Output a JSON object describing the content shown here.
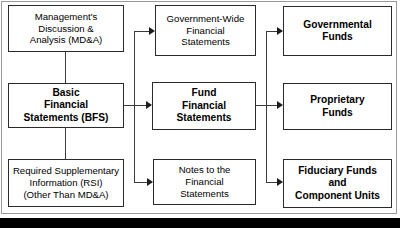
{
  "diagram": {
    "background_color": "#ffffff",
    "line_color": "#3a3a3a",
    "box_border_color": "#2b2b2b",
    "frame_color": "#9a9a9a",
    "bottom_bar_color": "#000000",
    "nodes": [
      {
        "id": "mda",
        "label": "Management's\nDiscussion &\nAnalysis (MD&A)",
        "weight": "normal",
        "column": "left",
        "row": "top"
      },
      {
        "id": "bfs",
        "label": "Basic\nFinancial\nStatements (BFS)",
        "weight": "bold",
        "column": "left",
        "row": "middle"
      },
      {
        "id": "rsi",
        "label": "Required Supplementary\nInformation (RSI)\n(Other Than MD&A)",
        "weight": "normal",
        "column": "left",
        "row": "bottom"
      },
      {
        "id": "gwfs",
        "label": "Government-Wide\nFinancial\nStatements",
        "weight": "normal",
        "column": "middle",
        "row": "top"
      },
      {
        "id": "ffs",
        "label": "Fund\nFinancial\nStatements",
        "weight": "bold",
        "column": "middle",
        "row": "middle"
      },
      {
        "id": "notes",
        "label": "Notes to the\nFinancial\nStatements",
        "weight": "normal",
        "column": "middle",
        "row": "bottom"
      },
      {
        "id": "governmental",
        "label": "Governmental\nFunds",
        "weight": "bold",
        "column": "right",
        "row": "top"
      },
      {
        "id": "proprietary",
        "label": "Proprietary\nFunds",
        "weight": "bold",
        "column": "right",
        "row": "middle"
      },
      {
        "id": "fiduciary",
        "label": "Fiduciary Funds\nand\nComponent Units",
        "weight": "bold",
        "column": "right",
        "row": "bottom"
      }
    ],
    "connectors": [
      {
        "id": "mda-to-bfs",
        "from": "mda",
        "to": "bfs",
        "style": "plain-vertical"
      },
      {
        "id": "bfs-to-rsi",
        "from": "bfs",
        "to": "rsi",
        "style": "plain-vertical"
      },
      {
        "id": "bfs-to-gwfs",
        "from": "bfs",
        "to": "gwfs",
        "style": "arrow"
      },
      {
        "id": "bfs-to-ffs",
        "from": "bfs",
        "to": "ffs",
        "style": "arrow"
      },
      {
        "id": "bfs-to-notes",
        "from": "bfs",
        "to": "notes",
        "style": "arrow"
      },
      {
        "id": "ffs-to-governmental",
        "from": "ffs",
        "to": "governmental",
        "style": "arrow"
      },
      {
        "id": "ffs-to-proprietary",
        "from": "ffs",
        "to": "proprietary",
        "style": "arrow"
      },
      {
        "id": "ffs-to-fiduciary",
        "from": "ffs",
        "to": "fiduciary",
        "style": "arrow"
      }
    ]
  }
}
